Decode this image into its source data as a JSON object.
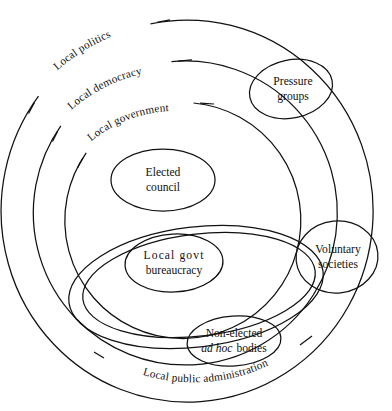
{
  "figure": {
    "type": "venn-euler-diagram",
    "background_color": "#ffffff",
    "stroke_color": "#111111"
  },
  "rings": {
    "outer": {
      "label": "Local politics"
    },
    "middle": {
      "label": "Local democracy"
    },
    "inner": {
      "label": "Local government"
    },
    "administration": {
      "label": "Local public administration"
    }
  },
  "nodes": {
    "elected_council": {
      "line1": "Elected",
      "line2": "council"
    },
    "local_govt_bureaucracy": {
      "line1": "Local  govt",
      "line2": "bureaucracy"
    },
    "pressure_groups": {
      "line1": "Pressure",
      "line2": "groups"
    },
    "voluntary_societies": {
      "line1": "Voluntary",
      "line2": "societies"
    },
    "non_elected_bodies": {
      "line1": "Non-elected",
      "line2_italic": "ad hoc",
      "line2_roman": "bodies"
    }
  }
}
